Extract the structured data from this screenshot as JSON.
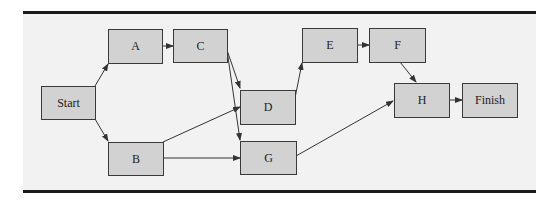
{
  "diagram": {
    "type": "activity-network",
    "colors": {
      "node_fill": "#d2d2d2",
      "node_border": "#3a3a3a",
      "edge": "#333333",
      "panel": "#f2f2f2",
      "rule": "#1a1a1a"
    },
    "nodes": {
      "start": {
        "label": "Start"
      },
      "a": {
        "label": "A"
      },
      "b": {
        "label": "B"
      },
      "c": {
        "label": "C"
      },
      "d": {
        "label": "D"
      },
      "e": {
        "label": "E"
      },
      "f": {
        "label": "F"
      },
      "g": {
        "label": "G"
      },
      "h": {
        "label": "H"
      },
      "finish": {
        "label": "Finish"
      }
    },
    "edges": [
      [
        "Start",
        "A"
      ],
      [
        "Start",
        "B"
      ],
      [
        "A",
        "C"
      ],
      [
        "C",
        "D"
      ],
      [
        "C",
        "G"
      ],
      [
        "B",
        "D"
      ],
      [
        "B",
        "G"
      ],
      [
        "D",
        "E"
      ],
      [
        "E",
        "F"
      ],
      [
        "F",
        "H"
      ],
      [
        "G",
        "H"
      ],
      [
        "H",
        "Finish"
      ]
    ]
  }
}
